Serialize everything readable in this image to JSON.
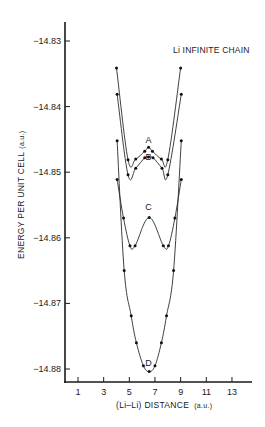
{
  "chart_data": {
    "type": "line",
    "title": "Li INFINITE CHAIN",
    "xlabel": "(Li–Li) DISTANCE",
    "xlabel_unit": "(a.u.)",
    "ylabel": "ENERGY PER UNIT CELL",
    "ylabel_unit": "(a.u.)",
    "xlim": [
      0,
      14
    ],
    "ylim": [
      -14.8805,
      -14.827
    ],
    "x_ticks": [
      1,
      3,
      5,
      7,
      9,
      11,
      13
    ],
    "y_ticks": [
      -14.83,
      -14.84,
      -14.85,
      -14.86,
      -14.87,
      -14.88
    ],
    "y_tick_labels": [
      "−14.83",
      "−14.84",
      "−14.85",
      "−14.86",
      "−14.87",
      "−14.88"
    ],
    "grid": false,
    "legend": "none (curves labeled inline A, B, C, D)",
    "series": [
      {
        "name": "A",
        "x": [
          4.0,
          4.9,
          5.5,
          6.2,
          6.5,
          6.8,
          7.5,
          8.0,
          9.0
        ],
        "y": [
          -14.8341,
          -14.8481,
          -14.848,
          -14.8468,
          -14.8462,
          -14.8468,
          -14.848,
          -14.8481,
          -14.8341
        ]
      },
      {
        "name": "B",
        "x": [
          4.05,
          4.9,
          5.5,
          6.2,
          6.5,
          6.85,
          7.55,
          8.0,
          9.05
        ],
        "y": [
          -14.8381,
          -14.8504,
          -14.8494,
          -14.8478,
          -14.8477,
          -14.8478,
          -14.8494,
          -14.8504,
          -14.8381
        ]
      },
      {
        "name": "C",
        "x": [
          4.05,
          4.55,
          5.05,
          5.45,
          6.55,
          7.65,
          8.05,
          8.55,
          9.05
        ],
        "y": [
          -14.8511,
          -14.857,
          -14.8612,
          -14.8612,
          -14.8569,
          -14.8612,
          -14.8612,
          -14.857,
          -14.8511
        ]
      },
      {
        "name": "D",
        "x": [
          4.05,
          4.6,
          5.15,
          5.55,
          6.1,
          6.55,
          7.0,
          7.5,
          7.9,
          8.45,
          9.05
        ],
        "y": [
          -14.8452,
          -14.865,
          -14.8719,
          -14.876,
          -14.8795,
          -14.8804,
          -14.8795,
          -14.876,
          -14.8719,
          -14.865,
          -14.8452
        ]
      }
    ],
    "annotations": [
      {
        "text": "A",
        "x": 6.5,
        "y": -14.8455
      },
      {
        "text": "B",
        "x": 6.5,
        "y": -14.8482
      },
      {
        "text": "C",
        "x": 6.5,
        "y": -14.8557
      },
      {
        "text": "D",
        "x": 6.5,
        "y": -14.8796
      }
    ]
  }
}
